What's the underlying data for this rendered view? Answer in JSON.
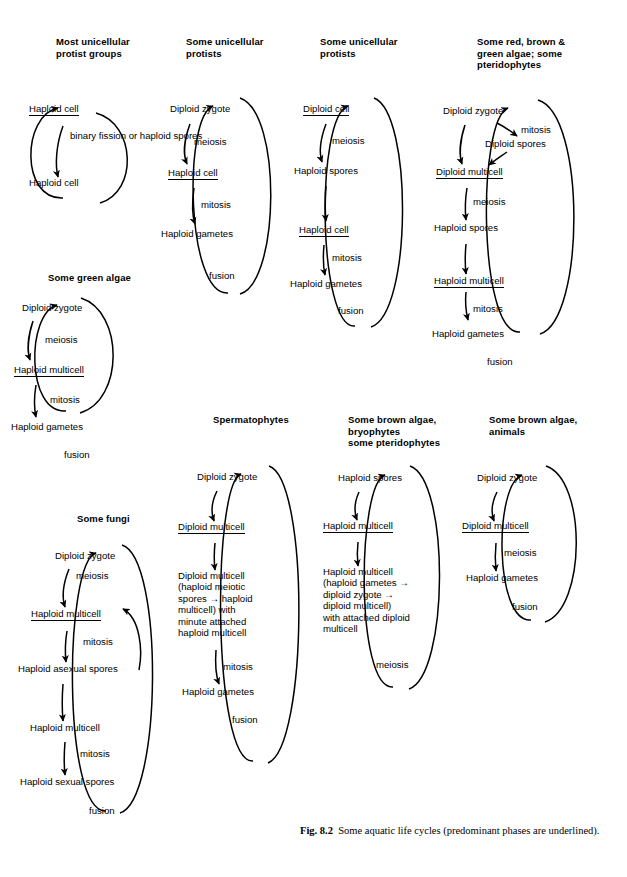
{
  "figure": {
    "caption_label": "Fig. 8.2",
    "caption_text": "Some aquatic life cycles (predominant phases are underlined)."
  },
  "cycles": [
    {
      "id": "most-unicellular-protist-groups",
      "heading": "Most unicellular\nprotist groups",
      "nodes": [
        {
          "label": "Haploid cell",
          "underlined": true
        },
        {
          "label": "Haploid cell",
          "underlined": false
        }
      ],
      "processes": [
        "binary fission\nor haploid\nspores"
      ]
    },
    {
      "id": "some-unicellular-protists-a",
      "heading": "Some unicellular\nprotists",
      "nodes": [
        {
          "label": "Diploid zygote",
          "underlined": false
        },
        {
          "label": "Haploid cell",
          "underlined": true
        },
        {
          "label": "Haploid gametes",
          "underlined": false
        }
      ],
      "processes": [
        "meiosis",
        "mitosis",
        "fusion"
      ]
    },
    {
      "id": "some-unicellular-protists-b",
      "heading": "Some unicellular\nprotists",
      "nodes": [
        {
          "label": "Diploid cell",
          "underlined": true
        },
        {
          "label": "Haploid spores",
          "underlined": false
        },
        {
          "label": "Haploid cell",
          "underlined": true
        },
        {
          "label": "Haploid gametes",
          "underlined": false
        }
      ],
      "processes": [
        "meiosis",
        "mitosis",
        "fusion"
      ]
    },
    {
      "id": "some-red-brown-green-algae",
      "heading": "Some red, brown &\ngreen algae; some\npteridophytes",
      "nodes": [
        {
          "label": "Diploid zygote",
          "underlined": false
        },
        {
          "label": "Diploid spores",
          "underlined": false
        },
        {
          "label": "Diploid multicell",
          "underlined": true
        },
        {
          "label": "Haploid spores",
          "underlined": false
        },
        {
          "label": "Haploid multicell",
          "underlined": true
        },
        {
          "label": "Haploid gametes",
          "underlined": false
        }
      ],
      "processes": [
        "mitosis",
        "meiosis",
        "mitosis",
        "fusion"
      ]
    },
    {
      "id": "some-green-algae",
      "heading": "Some green algae",
      "nodes": [
        {
          "label": "Diploid zygote",
          "underlined": false
        },
        {
          "label": "Haploid multicell",
          "underlined": true
        },
        {
          "label": "Haploid gametes",
          "underlined": false
        }
      ],
      "processes": [
        "meiosis",
        "mitosis",
        "fusion"
      ]
    },
    {
      "id": "some-fungi",
      "heading": "Some fungi",
      "nodes": [
        {
          "label": "Diploid zygote",
          "underlined": false
        },
        {
          "label": "Haploid multicell",
          "underlined": true
        },
        {
          "label": "Haploid asexual spores",
          "underlined": false
        },
        {
          "label": "Haploid multicell",
          "underlined": false
        },
        {
          "label": "Haploid sexual spores",
          "underlined": false
        }
      ],
      "processes": [
        "meiosis",
        "mitosis",
        "mitosis",
        "fusion"
      ]
    },
    {
      "id": "spermatophytes",
      "heading": "Spermatophytes",
      "nodes": [
        {
          "label": "Diploid zygote",
          "underlined": false
        },
        {
          "label": "Diploid multicell",
          "underlined": true
        },
        {
          "label": "Diploid multicell\n(haploid meiotic\nspores → haploid\nmulticell) with\nminute attached\nhaploid multicell",
          "underlined": false
        },
        {
          "label": "Haploid gametes",
          "underlined": false
        }
      ],
      "processes": [
        "mitosis",
        "fusion"
      ]
    },
    {
      "id": "some-brown-algae-bryophytes",
      "heading": "Some brown algae,\nbryophytes\nsome pteridophytes",
      "nodes": [
        {
          "label": "Haploid spores",
          "underlined": false
        },
        {
          "label": "Haploid multicell",
          "underlined": true
        },
        {
          "label": "Haploid multicell\n(haploid gametes →\ndiploid zygote →\ndiploid multicell)\nwith attached diploid\nmulticell",
          "underlined": false
        }
      ],
      "processes": [
        "meiosis"
      ]
    },
    {
      "id": "some-brown-algae-animals",
      "heading": "Some brown algae,\nanimals",
      "nodes": [
        {
          "label": "Diploid zygote",
          "underlined": false
        },
        {
          "label": "Diploid multicell",
          "underlined": true
        },
        {
          "label": "Haploid gametes",
          "underlined": false
        }
      ],
      "processes": [
        "meiosis",
        "fusion"
      ]
    }
  ]
}
